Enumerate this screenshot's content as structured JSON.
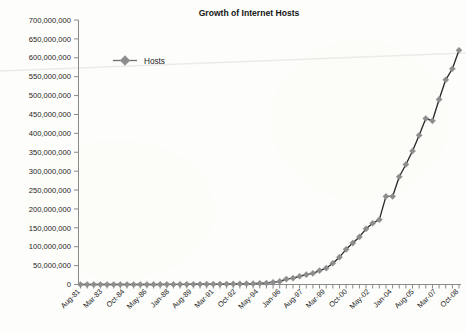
{
  "chart_data": {
    "type": "line",
    "title": "Growth of Internet Hosts",
    "xlabel": "",
    "ylabel": "",
    "ylim": [
      0,
      700000000
    ],
    "ytick_step": 50000000,
    "grid": false,
    "legend_position": "inside-upper-left",
    "legend_entries": [
      "Hosts"
    ],
    "series": [
      {
        "name": "Hosts",
        "marker": "diamond",
        "marker_color": "#8d8d8d",
        "line_color": "#2b2b2b",
        "x": [
          "Aug-81",
          "Aug-82",
          "May-82",
          "Aug-83",
          "Oct-84",
          "Oct-85",
          "Feb-86",
          "Nov-86",
          "Dec-87",
          "Jul-88",
          "Oct-88",
          "Jan-89",
          "Jul-89",
          "Oct-89",
          "Oct-90",
          "Jan-91",
          "Jul-91",
          "Oct-91",
          "Jan-92",
          "Apr-92",
          "Jul-92",
          "Oct-92",
          "Jan-93",
          "Apr-93",
          "Jul-93",
          "Oct-93",
          "Jan-94",
          "Jul-94",
          "Oct-94",
          "Jan-95",
          "Jul-95",
          "Jan-96",
          "Jul-96",
          "Jan-97",
          "Jul-97",
          "Jan-98",
          "Jul-98",
          "Jan-99",
          "Jul-99",
          "Jan-00",
          "Jul-00",
          "Jan-01",
          "Jul-01",
          "Jan-02",
          "Jul-02",
          "Jan-03",
          "Jul-03",
          "Jan-04",
          "Jul-04",
          "Jan-05",
          "Jul-05",
          "Jan-06",
          "Jul-06",
          "Jan-07",
          "Jul-07",
          "Jan-08",
          "Jul-08",
          "Oct-08"
        ],
        "values": [
          213,
          235,
          562,
          1024,
          1961,
          2308,
          5089,
          5089,
          28174,
          33000,
          56000,
          80000,
          130000,
          159000,
          313000,
          376000,
          535000,
          617000,
          727000,
          890000,
          992000,
          1136000,
          1313000,
          1486000,
          1776000,
          2056000,
          2217000,
          3212000,
          3864000,
          5846000,
          8200000,
          14352000,
          16729000,
          21819000,
          26053000,
          29670000,
          36739000,
          43230000,
          56218000,
          72398000,
          93047000,
          109574000,
          125888000,
          147344000,
          162128000,
          171638000,
          233101000,
          233101000,
          285139000,
          317646000,
          353284000,
          394992000,
          439286000,
          433193000,
          489774000,
          541677000,
          570937000,
          620000000
        ]
      }
    ],
    "xtick_labels": [
      "Aug-81",
      "Mar-83",
      "Oct-84",
      "May-86",
      "Jan-88",
      "Aug-89",
      "Mar-91",
      "Oct-92",
      "May-94",
      "Jan-96",
      "Aug-97",
      "Mar-99",
      "Oct-00",
      "May-02",
      "Jan-04",
      "Aug-05",
      "Mar-07",
      "Oct-08"
    ],
    "ytick_labels": [
      "700,000,000",
      "650,000,000",
      "600,000,000",
      "550,000,000",
      "500,000,000",
      "450,000,000",
      "400,000,000",
      "350,000,000",
      "300,000,000",
      "250,000,000",
      "200,000,000",
      "150,000,000",
      "100,000,000",
      "50,000,000",
      "0"
    ]
  },
  "colors": {
    "line": "#2b2b2b",
    "marker": "#8d8d8d",
    "axis": "#8a8a8a",
    "text": "#1d1d1d",
    "background": "#fdfdfb"
  },
  "caption": ""
}
